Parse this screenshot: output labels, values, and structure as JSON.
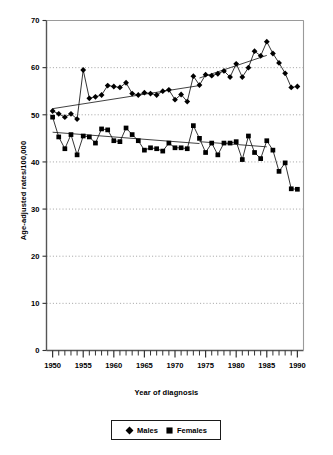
{
  "chart_data": {
    "type": "line",
    "title": "",
    "xlabel": "Year of diagnosis",
    "ylabel": "Age-adjusted rates/100,000",
    "xlim": [
      1949,
      1991
    ],
    "ylim": [
      0,
      70
    ],
    "x_ticks_major": [
      1950,
      1955,
      1960,
      1965,
      1970,
      1975,
      1980,
      1985,
      1990
    ],
    "x_tick_labels": [
      "1950",
      "1955",
      "1960",
      "1965",
      "1970",
      "1975",
      "1980",
      "1985",
      "1990"
    ],
    "x_tick_interval_minor": 1,
    "y_ticks": [
      0,
      10,
      20,
      30,
      40,
      50,
      60,
      70
    ],
    "y_tick_labels": [
      "0",
      "10",
      "20",
      "30",
      "40",
      "50",
      "60",
      "70"
    ],
    "grid": "horizontal-dotted",
    "legend_position": "below-plot",
    "x": [
      1950,
      1951,
      1952,
      1953,
      1954,
      1955,
      1956,
      1957,
      1958,
      1959,
      1960,
      1961,
      1962,
      1963,
      1964,
      1965,
      1966,
      1967,
      1968,
      1969,
      1970,
      1971,
      1972,
      1973,
      1974,
      1975,
      1976,
      1977,
      1978,
      1979,
      1980,
      1981,
      1982,
      1983,
      1984,
      1985,
      1986,
      1987,
      1988,
      1989,
      1990
    ],
    "series": [
      {
        "name": "Males",
        "marker": "diamond",
        "values": [
          50.8,
          50.2,
          49.5,
          50.2,
          49.1,
          59.5,
          53.5,
          53.8,
          54.2,
          56.2,
          56.0,
          55.8,
          56.8,
          54.5,
          54.2,
          54.7,
          54.5,
          54.2,
          55.0,
          55.3,
          53.2,
          54.3,
          52.8,
          58.2,
          56.3,
          58.5,
          58.3,
          58.7,
          59.3,
          58.0,
          60.8,
          58.0,
          60.0,
          63.5,
          62.5,
          65.5,
          63.0,
          61.0,
          58.8,
          55.8,
          56.0
        ],
        "trend_segments": [
          {
            "x0": 1950,
            "y0": 51.3,
            "x1": 1974,
            "y1": 56.2
          },
          {
            "x0": 1974,
            "y0": 57.8,
            "x1": 1985,
            "y1": 62.6
          }
        ]
      },
      {
        "name": "Females",
        "marker": "square",
        "values": [
          49.5,
          45.3,
          42.8,
          45.8,
          41.5,
          45.5,
          45.3,
          44.0,
          47.0,
          46.8,
          44.5,
          44.3,
          47.2,
          45.8,
          44.5,
          42.5,
          43.0,
          42.8,
          42.3,
          44.0,
          43.0,
          43.0,
          42.8,
          47.7,
          45.0,
          42.0,
          44.0,
          41.5,
          44.0,
          44.0,
          44.3,
          40.5,
          45.5,
          42.0,
          40.7,
          44.5,
          42.5,
          38.0,
          39.8,
          34.3,
          34.2
        ],
        "trend_segments": [
          {
            "x0": 1950,
            "y0": 46.3,
            "x1": 1974,
            "y1": 43.9
          },
          {
            "x0": 1974,
            "y0": 44.3,
            "x1": 1985,
            "y1": 43.2
          }
        ]
      }
    ]
  },
  "legend": {
    "entries": [
      {
        "label": "Males",
        "marker": "diamond"
      },
      {
        "label": "Females",
        "marker": "square"
      }
    ]
  }
}
